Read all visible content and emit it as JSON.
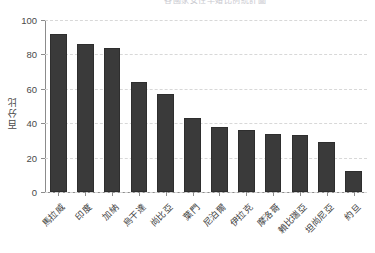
{
  "chart_data": {
    "type": "bar",
    "title": "各國家女性早婚比例統計圖",
    "xlabel": "",
    "ylabel": "百分比",
    "ylim": [
      0,
      100
    ],
    "yticks": [
      0,
      20,
      40,
      60,
      80,
      100
    ],
    "grid": true,
    "legend": "none",
    "bar_color": "#3a3a3a",
    "categories": [
      "馬拉威",
      "印度",
      "加納",
      "烏干達",
      "尚比亞",
      "葉門",
      "尼泊爾",
      "伊拉克",
      "摩洛哥",
      "賴比瑞亞",
      "坦尚尼亞",
      "約旦"
    ],
    "values": [
      92,
      86,
      84,
      64,
      57,
      43,
      38,
      36,
      34,
      33,
      29,
      12
    ]
  },
  "axes": {
    "y_axis_label": "百分比",
    "y_tick_labels": [
      "100",
      "80",
      "60",
      "40",
      "20",
      "0"
    ]
  }
}
